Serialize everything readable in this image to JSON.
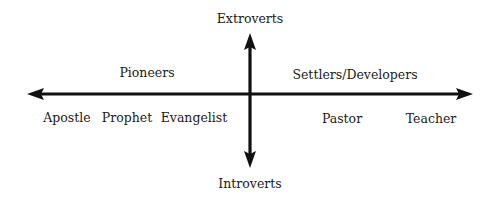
{
  "diagram": {
    "vertical_axis": {
      "top_label": "Extroverts",
      "bottom_label": "Introverts"
    },
    "horizontal_axis": {
      "left_group_label": "Pioneers",
      "right_group_label": "Settlers/Developers"
    },
    "roles": [
      {
        "label": "Apostle"
      },
      {
        "label": "Prophet"
      },
      {
        "label": "Evangelist"
      },
      {
        "label": "Pastor"
      },
      {
        "label": "Teacher"
      }
    ],
    "colors": {
      "axis": "#111111",
      "text": "#1a1a1a",
      "background": "#ffffff"
    }
  }
}
